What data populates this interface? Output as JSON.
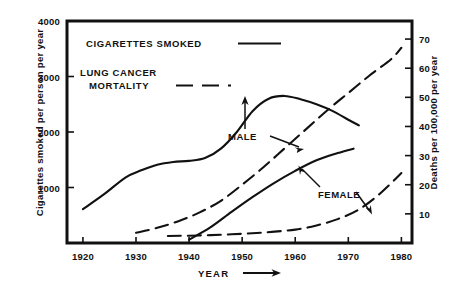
{
  "chart_data": {
    "type": "line",
    "title": "",
    "xlabel": "YEAR",
    "xlabel_suffix": "→",
    "ylabel_left": "Cigarettes smoked per person per year",
    "ylabel_right": "Deaths per 100,000 per year",
    "xlim": [
      1917,
      1982
    ],
    "xticks": [
      1920,
      1930,
      1940,
      1950,
      1960,
      1970,
      1980
    ],
    "xticklabels": [
      "1920",
      "1930",
      "1940",
      "1950",
      "1960",
      "1970",
      "1980"
    ],
    "ylim_left": [
      0,
      4000
    ],
    "yticks_left": [
      1000,
      2000,
      3000,
      4000
    ],
    "yticklabels_left": [
      "1000",
      "2000",
      "3000",
      "4000"
    ],
    "ylim_right": [
      0,
      76.2
    ],
    "yticks_right": [
      10,
      20,
      30,
      40,
      50,
      60,
      70
    ],
    "yticklabels_right": [
      "10",
      "20",
      "30",
      "40",
      "50",
      "60",
      "70"
    ],
    "grid": false,
    "legend_position": "upper-left",
    "series": [
      {
        "name": "Cigarettes smoked – male",
        "axis": "left",
        "style": "solid",
        "color": "#111111",
        "annotation": "MALE",
        "x": [
          1920,
          1924,
          1928,
          1931,
          1934,
          1937,
          1940,
          1943,
          1946,
          1949,
          1952,
          1955,
          1958,
          1961,
          1964,
          1967,
          1970,
          1972
        ],
        "y": [
          610,
          880,
          1180,
          1310,
          1410,
          1460,
          1480,
          1530,
          1700,
          2000,
          2380,
          2600,
          2650,
          2590,
          2500,
          2380,
          2220,
          2120
        ]
      },
      {
        "name": "Cigarettes smoked – female",
        "axis": "left",
        "style": "solid",
        "color": "#111111",
        "annotation": "FEMALE",
        "x": [
          1940,
          1944,
          1948,
          1952,
          1956,
          1960,
          1964,
          1968,
          1971
        ],
        "y": [
          60,
          280,
          560,
          830,
          1080,
          1300,
          1490,
          1620,
          1700
        ]
      },
      {
        "name": "Lung cancer mortality – male",
        "axis": "right",
        "style": "dashed",
        "color": "#111111",
        "annotation": "MALE",
        "x": [
          1930,
          1934,
          1938,
          1942,
          1946,
          1950,
          1954,
          1958,
          1962,
          1966,
          1970,
          1974,
          1978,
          1980
        ],
        "y": [
          3.5,
          5.2,
          7.5,
          10.5,
          14.5,
          20.0,
          26.0,
          32.5,
          39.0,
          45.5,
          51.5,
          57.5,
          63.0,
          67.0
        ]
      },
      {
        "name": "Lung cancer mortality – female",
        "axis": "right",
        "style": "dashed",
        "color": "#111111",
        "annotation": "FEMALE",
        "x": [
          1936,
          1942,
          1948,
          1954,
          1960,
          1964,
          1968,
          1972,
          1976,
          1980
        ],
        "y": [
          2.4,
          2.6,
          3.0,
          3.6,
          4.6,
          6.0,
          8.2,
          11.5,
          17.0,
          24.0
        ]
      }
    ],
    "annotations": [
      {
        "label": "MALE",
        "x": 1943.5,
        "y_left": 2100
      },
      {
        "label": "FEMALE",
        "x": 1959.0,
        "y_left": 780
      }
    ]
  },
  "legend": {
    "entries": [
      {
        "label_line1": "CIGARETTES  SMOKED",
        "label_line2": "",
        "style": "solid"
      },
      {
        "label_line1": "LUNG  CANCER",
        "label_line2": "MORTALITY",
        "style": "dashed"
      }
    ]
  },
  "colors": {
    "ink": "#111111",
    "background": "#ffffff"
  }
}
